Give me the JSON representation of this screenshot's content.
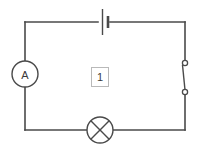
{
  "figure": {
    "type": "electrical-circuit-schematic",
    "tag_label": "1",
    "background_color": "#ffffff",
    "line_color": "#4a4a4a",
    "tag_border_color": "#b9b9b9"
  },
  "components": {
    "ammeter": {
      "symbol_name": "ammeter-icon",
      "label": "A",
      "position": "left-branch",
      "cx": 25,
      "cy": 74,
      "r": 13
    },
    "battery": {
      "symbol_name": "battery-icon",
      "label": "",
      "position": "top-branch",
      "cx": 104,
      "cy": 22
    },
    "switch": {
      "symbol_name": "switch-open-icon",
      "label": "",
      "position": "right-branch",
      "state": "open",
      "terminal_top_y": 63,
      "terminal_bottom_y": 92,
      "x": 185
    },
    "lamp": {
      "symbol_name": "lamp-icon",
      "label": "",
      "position": "bottom-branch",
      "cx": 100,
      "cy": 130,
      "r": 13
    }
  },
  "loop": {
    "left_x": 25,
    "right_x": 185,
    "top_y": 22,
    "bottom_y": 130
  }
}
